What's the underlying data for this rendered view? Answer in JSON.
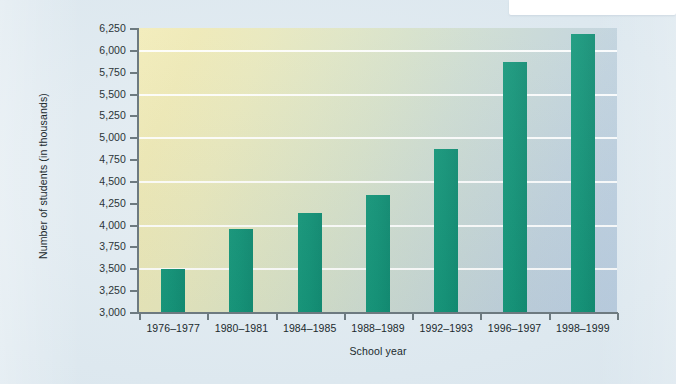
{
  "header": {
    "plate_name": "top-right-white-plate",
    "rule_color": "#4b4f86"
  },
  "theme": {
    "bar_color": "#16977a",
    "axis_color": "#6d7a80",
    "gridline_color": "#ffffff",
    "plot_gradient_start": "#f2ecb9",
    "plot_gradient_end": "#bcd0e3",
    "page_background": "#dfeaf0",
    "text_color": "#20292d"
  },
  "chart_data": {
    "type": "bar",
    "title": "",
    "xlabel": "School year",
    "ylabel": "Number of students (in thousands)",
    "categories": [
      "1976–1977",
      "1980–1981",
      "1984–1985",
      "1988–1989",
      "1992–1993",
      "1996–1997",
      "1998–1999"
    ],
    "values": [
      3490,
      3950,
      4130,
      4340,
      4870,
      5860,
      6180
    ],
    "ylim": [
      3000,
      6250
    ],
    "ytick_values": [
      3000,
      3250,
      3500,
      3750,
      4000,
      4250,
      4500,
      4750,
      5000,
      5250,
      5500,
      5750,
      6000,
      6250
    ],
    "ytick_labels": [
      "3,000",
      "3,250",
      "3,500",
      "3,750",
      "4,000",
      "4,250",
      "4,500",
      "4,750",
      "5,000",
      "5,250",
      "5,500",
      "5,750",
      "6,000",
      "6,250"
    ],
    "gridline_values": [
      3500,
      4000,
      4500,
      5000,
      5500,
      6000
    ],
    "grid": true,
    "legend": null,
    "legend_position": "none"
  }
}
